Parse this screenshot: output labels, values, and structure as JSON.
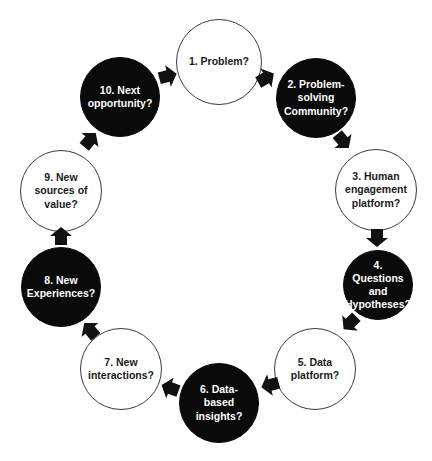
{
  "diagram": {
    "type": "cycle",
    "nodes": [
      {
        "id": 1,
        "label": "1. Problem?",
        "style": "light",
        "cx": 219,
        "cy": 62,
        "r": 43
      },
      {
        "id": 2,
        "label": "2. Problem-\nsolving\nCommunity?",
        "style": "dark",
        "cx": 316,
        "cy": 98,
        "r": 40
      },
      {
        "id": 3,
        "label": "3. Human\nengagement\nplatform?",
        "style": "light",
        "cx": 376,
        "cy": 190,
        "r": 41
      },
      {
        "id": 4,
        "label": "4.\nQuestions\nand\nHypotheses?",
        "style": "dark",
        "cx": 378,
        "cy": 285,
        "r": 35
      },
      {
        "id": 5,
        "label": "5. Data\nplatform?",
        "style": "light",
        "cx": 315,
        "cy": 369,
        "r": 41
      },
      {
        "id": 6,
        "label": "6. Data-\nbased\ninsights?",
        "style": "dark",
        "cx": 219,
        "cy": 403,
        "r": 40
      },
      {
        "id": 7,
        "label": "7. New\ninteractions?",
        "style": "light",
        "cx": 121,
        "cy": 369,
        "r": 41
      },
      {
        "id": 8,
        "label": "8. New\nExperiences?",
        "style": "dark",
        "cx": 61,
        "cy": 287,
        "r": 40
      },
      {
        "id": 9,
        "label": "9. New\nsources of\nvalue?",
        "style": "light",
        "cx": 61,
        "cy": 191,
        "r": 41
      },
      {
        "id": 10,
        "label": "10. Next\nopportunity?",
        "style": "dark",
        "cx": 120,
        "cy": 97,
        "r": 40
      }
    ],
    "arrows": [
      {
        "from": 1,
        "to": 2,
        "x": 266,
        "y": 78,
        "angle": 60
      },
      {
        "from": 2,
        "to": 3,
        "x": 343,
        "y": 141,
        "angle": 140
      },
      {
        "from": 3,
        "to": 4,
        "x": 377,
        "y": 238,
        "angle": 180
      },
      {
        "from": 4,
        "to": 5,
        "x": 350,
        "y": 323,
        "angle": 225
      },
      {
        "from": 5,
        "to": 6,
        "x": 270,
        "y": 385,
        "angle": 255
      },
      {
        "from": 6,
        "to": 7,
        "x": 170,
        "y": 388,
        "angle": 290
      },
      {
        "from": 7,
        "to": 8,
        "x": 90,
        "y": 330,
        "angle": 320
      },
      {
        "from": 8,
        "to": 9,
        "x": 61,
        "y": 236,
        "angle": 0
      },
      {
        "from": 9,
        "to": 10,
        "x": 90,
        "y": 140,
        "angle": 40
      },
      {
        "from": 10,
        "to": 1,
        "x": 168,
        "y": 76,
        "angle": 75
      }
    ],
    "colors": {
      "dark_fill": "#0a0a0a",
      "light_fill": "#ffffff",
      "outline": "#3a3a3a",
      "arrow": "#111111"
    }
  }
}
